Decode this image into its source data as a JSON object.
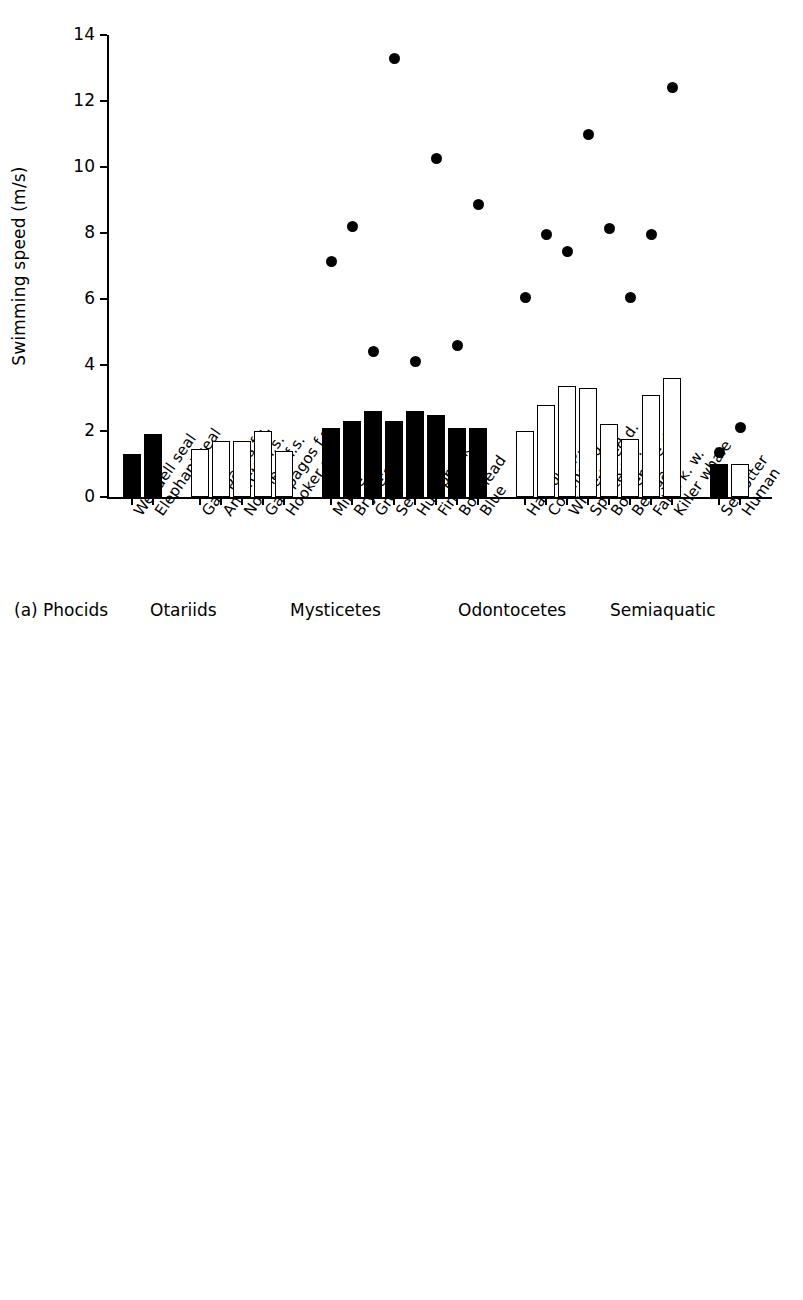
{
  "figure": {
    "panels": [
      "a",
      "b"
    ],
    "group_labels": [
      "Phocids",
      "Otariids",
      "Mysticetes",
      "Odontocetes",
      "Semiaquatic"
    ],
    "panel_a_tag": "(a)",
    "panel_b_tag": "(b)"
  },
  "chart_data": [
    {
      "type": "bar",
      "panel": "(a)",
      "title": "",
      "xlabel": "",
      "ylabel": "Swimming speed (m/s)",
      "ylim": [
        0,
        14
      ],
      "yticks": [
        0,
        2,
        4,
        6,
        8,
        10,
        12,
        14
      ],
      "ytick_labels": [
        "0",
        "2",
        "4",
        "6",
        "8",
        "10",
        "12",
        "14"
      ],
      "grid": false,
      "legend": "none",
      "groups": [
        {
          "name": "Phocids",
          "categories": [
            "Weddell seal",
            "Elephant seal"
          ],
          "bar_style": [
            "filled",
            "filled"
          ],
          "values": [
            1.3,
            1.9
          ],
          "dots": [
            null,
            null
          ]
        },
        {
          "name": "Otariids",
          "categories": [
            "Galápagos f.s.",
            "Antarctic f.s.",
            "Northern f.s.",
            "Galápagos f.s.",
            "Hooker s.l."
          ],
          "bar_style": [
            "open",
            "open",
            "open",
            "open",
            "open"
          ],
          "values": [
            1.45,
            1.7,
            1.7,
            2.0,
            1.4
          ],
          "dots": [
            null,
            null,
            null,
            null,
            null
          ]
        },
        {
          "name": "Mysticetes",
          "categories": [
            "Minke",
            "Bryde's",
            "Grey",
            "Sei",
            "Humpback",
            "Fin",
            "Bowhead",
            "Blue"
          ],
          "bar_style": [
            "filled",
            "filled",
            "filled",
            "filled",
            "filled",
            "filled",
            "filled",
            "filled"
          ],
          "values": [
            2.1,
            2.3,
            2.6,
            2.3,
            2.6,
            2.5,
            2.1,
            2.1
          ],
          "dots": [
            7.15,
            8.2,
            4.4,
            13.3,
            4.1,
            10.25,
            4.6,
            8.85
          ]
        },
        {
          "name": "Odontocetes",
          "categories": [
            "Harbour p.",
            "Common d.",
            "White-sided d.",
            "Spotted d.",
            "Bottlenose d.",
            "Beluga",
            "False k. w.",
            "Killer whale"
          ],
          "bar_style": [
            "open",
            "open",
            "open",
            "open",
            "open",
            "open",
            "open",
            "open"
          ],
          "values": [
            2.0,
            2.8,
            3.35,
            3.3,
            2.2,
            1.75,
            3.1,
            3.6
          ],
          "dots": [
            6.05,
            7.95,
            7.45,
            11.0,
            8.15,
            6.05,
            7.95,
            12.4
          ]
        },
        {
          "name": "Semiaquatic",
          "categories": [
            "Sea otter",
            "Human"
          ],
          "bar_style": [
            "filled",
            "open"
          ],
          "values": [
            1.0,
            1.0
          ],
          "dots": [
            1.35,
            2.1
          ]
        }
      ]
    },
    {
      "type": "bar",
      "panel": "(b)",
      "title": "",
      "xlabel": "",
      "ylabel": "Maximum dive (min)",
      "ylim": [
        0,
        90
      ],
      "yticks": [
        0,
        10,
        20,
        30,
        40,
        50,
        60,
        70,
        80,
        90
      ],
      "ytick_labels": [
        "0",
        "10",
        "20",
        "30",
        "40",
        "50",
        "60",
        "70",
        "80",
        "90"
      ],
      "grid": false,
      "legend": "none",
      "groups": [
        {
          "name": "Phocids",
          "categories": [
            "Weddell seal",
            "Elephant seal"
          ],
          "bar_style": [
            "filled",
            "filled"
          ],
          "values": [
            77,
            82
          ]
        },
        {
          "name": "Otariids",
          "categories": [
            "Galápagos f.s.",
            "Antarctic f.s.",
            "Northern f.s.",
            "Galápagos f.s.",
            "Hooker s.l."
          ],
          "bar_style": [
            "open",
            "open",
            "open",
            "open",
            "open"
          ],
          "values": [
            8,
            10,
            8,
            6.3,
            12
          ]
        },
        {
          "name": "Mysticetes",
          "categories": [
            "Minke",
            "Bryde's",
            "Grey",
            "Sei",
            "Humpback",
            "Fin",
            "Bowhead",
            "Blue"
          ],
          "bar_style": [
            "filled",
            "filled",
            "filled",
            "filled",
            "filled",
            "filled",
            "filled",
            "filled"
          ],
          "values": [
            17,
            20.3,
            26,
            15.3,
            21.2,
            30,
            79.7,
            50
          ]
        },
        {
          "name": "Odontocetes",
          "categories": [
            "Harbour p.",
            "Common d.",
            "White-sided d.",
            "Spotted d.",
            "Bottlenose d.",
            "Beluga",
            "False k. w.",
            "Killer whale"
          ],
          "bar_style": [
            "open",
            "open",
            "open",
            "open",
            "open",
            "open",
            "open",
            "open"
          ],
          "values": [
            12,
            5,
            6.2,
            5,
            12,
            25,
            15,
            0
          ]
        },
        {
          "name": "Semiaquatic",
          "categories": [
            "Sea otter",
            "Human"
          ],
          "bar_style": [
            "filled",
            "filled"
          ],
          "values": [
            5,
            2
          ]
        }
      ]
    }
  ]
}
